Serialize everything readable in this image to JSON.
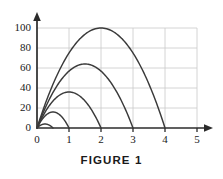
{
  "figure": {
    "caption": "FIGURE 1"
  },
  "chart_data": {
    "type": "line",
    "title": "FIGURE 1",
    "xlabel": "",
    "ylabel": "",
    "xlim": [
      0,
      5.45
    ],
    "ylim": [
      0,
      108
    ],
    "grid": true,
    "legend": "none",
    "x_ticks": [
      "0",
      "1",
      "2",
      "3",
      "4",
      "5"
    ],
    "x_tick_values": [
      0,
      1,
      2,
      3,
      4,
      5
    ],
    "y_ticks": [
      "0",
      "20",
      "40",
      "60",
      "80",
      "100"
    ],
    "y_tick_values": [
      0,
      20,
      40,
      60,
      80,
      100
    ],
    "series": [
      {
        "name": "trajectory-1",
        "peak_x": 0.25,
        "peak_y": 4,
        "range_x": 0.5,
        "x": [
          0,
          0.05,
          0.1,
          0.15,
          0.2,
          0.25,
          0.3,
          0.35,
          0.4,
          0.45,
          0.5
        ],
        "y": [
          0,
          1.44,
          2.56,
          3.36,
          3.84,
          4,
          3.84,
          3.36,
          2.56,
          1.44,
          0
        ]
      },
      {
        "name": "trajectory-2",
        "peak_x": 0.5,
        "peak_y": 16,
        "range_x": 1.0,
        "x": [
          0,
          0.1,
          0.2,
          0.3,
          0.4,
          0.5,
          0.6,
          0.7,
          0.8,
          0.9,
          1.0
        ],
        "y": [
          0,
          5.76,
          10.24,
          13.44,
          15.36,
          16,
          15.36,
          13.44,
          10.24,
          5.76,
          0
        ]
      },
      {
        "name": "trajectory-3",
        "peak_x": 1.0,
        "peak_y": 36,
        "range_x": 2.0,
        "x": [
          0,
          0.2,
          0.4,
          0.6,
          0.8,
          1.0,
          1.2,
          1.4,
          1.6,
          1.8,
          2.0
        ],
        "y": [
          0,
          12.96,
          23.04,
          30.24,
          34.56,
          36,
          34.56,
          30.24,
          23.04,
          12.96,
          0
        ]
      },
      {
        "name": "trajectory-4",
        "peak_x": 1.5,
        "peak_y": 64,
        "range_x": 3.0,
        "x": [
          0,
          0.3,
          0.6,
          0.9,
          1.2,
          1.5,
          1.8,
          2.1,
          2.4,
          2.7,
          3.0
        ],
        "y": [
          0,
          23.04,
          40.96,
          53.76,
          61.44,
          64,
          61.44,
          53.76,
          40.96,
          23.04,
          0
        ]
      },
      {
        "name": "trajectory-5",
        "peak_x": 2.0,
        "peak_y": 100,
        "range_x": 4.0,
        "x": [
          0,
          0.4,
          0.8,
          1.2,
          1.6,
          2.0,
          2.4,
          2.8,
          3.2,
          3.6,
          4.0
        ],
        "y": [
          0,
          36,
          64,
          84,
          96,
          100,
          96,
          84,
          64,
          36,
          0
        ]
      }
    ],
    "colors": {
      "curve": "#3a3a3a",
      "axis": "#2b2b2b",
      "grid": "#c9c9c9",
      "background": "#ffffff",
      "text": "#1a1a1a"
    }
  }
}
